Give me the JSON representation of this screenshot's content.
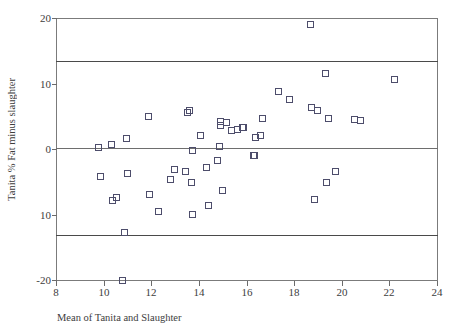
{
  "figure": {
    "faint_top_title": "",
    "marker_color": "#4d4d6b",
    "axis_color": "#6e6e6e",
    "reference_line_color": "#4a4a4a"
  },
  "chart_data": {
    "type": "scatter",
    "title": "",
    "xlabel": "Mean of Tanita and Slaughter",
    "ylabel": "Tanita % Fat minus slaughter",
    "xlim": [
      8,
      24
    ],
    "ylim": [
      -20,
      20
    ],
    "xticks": [
      8,
      10,
      12,
      14,
      16,
      18,
      20,
      22,
      24
    ],
    "xtick_labels": [
      "8",
      "10",
      "12",
      "14",
      "16",
      "18",
      "20",
      "22",
      "24"
    ],
    "yticks": [
      20,
      10,
      0,
      -10,
      -20
    ],
    "ytick_labels": [
      "20",
      "10",
      "0",
      "10",
      "-20"
    ],
    "grid": false,
    "legend": "none",
    "reference_lines": [
      {
        "label": "upper limit of agreement",
        "y": 13.4
      },
      {
        "label": "mean difference",
        "y": 0.1
      },
      {
        "label": "lower limit of agreement",
        "y": -13.2
      }
    ],
    "points": [
      {
        "x": 9.75,
        "y": 0.3
      },
      {
        "x": 9.85,
        "y": -4.1
      },
      {
        "x": 10.3,
        "y": 0.8
      },
      {
        "x": 10.35,
        "y": -7.8
      },
      {
        "x": 10.5,
        "y": -7.3
      },
      {
        "x": 10.75,
        "y": -20.0
      },
      {
        "x": 10.85,
        "y": -12.7
      },
      {
        "x": 10.95,
        "y": 1.7
      },
      {
        "x": 11.0,
        "y": -3.6
      },
      {
        "x": 11.85,
        "y": 5.0
      },
      {
        "x": 11.9,
        "y": -6.8
      },
      {
        "x": 12.3,
        "y": -9.4
      },
      {
        "x": 12.8,
        "y": -4.5
      },
      {
        "x": 12.95,
        "y": -3.0
      },
      {
        "x": 13.4,
        "y": -3.4
      },
      {
        "x": 13.5,
        "y": 5.6
      },
      {
        "x": 13.6,
        "y": 6.0
      },
      {
        "x": 13.65,
        "y": -5.0
      },
      {
        "x": 13.7,
        "y": -0.1
      },
      {
        "x": 13.7,
        "y": -9.9
      },
      {
        "x": 14.05,
        "y": 2.1
      },
      {
        "x": 14.3,
        "y": -2.7
      },
      {
        "x": 14.4,
        "y": -8.6
      },
      {
        "x": 14.75,
        "y": -1.7
      },
      {
        "x": 14.85,
        "y": 0.5
      },
      {
        "x": 14.9,
        "y": 4.3
      },
      {
        "x": 14.9,
        "y": 3.7
      },
      {
        "x": 14.95,
        "y": -6.3
      },
      {
        "x": 15.15,
        "y": 4.1
      },
      {
        "x": 15.35,
        "y": 2.9
      },
      {
        "x": 15.6,
        "y": 3.1
      },
      {
        "x": 15.8,
        "y": 3.4
      },
      {
        "x": 15.85,
        "y": 3.4
      },
      {
        "x": 16.25,
        "y": -0.9
      },
      {
        "x": 16.3,
        "y": -0.9
      },
      {
        "x": 16.35,
        "y": 1.9
      },
      {
        "x": 16.55,
        "y": 2.2
      },
      {
        "x": 16.65,
        "y": 4.7
      },
      {
        "x": 17.3,
        "y": 8.8
      },
      {
        "x": 17.8,
        "y": 7.6
      },
      {
        "x": 18.65,
        "y": 19.1
      },
      {
        "x": 18.7,
        "y": 6.4
      },
      {
        "x": 18.85,
        "y": -7.7
      },
      {
        "x": 18.95,
        "y": 5.9
      },
      {
        "x": 19.3,
        "y": 11.6
      },
      {
        "x": 19.35,
        "y": -5.1
      },
      {
        "x": 19.4,
        "y": 4.8
      },
      {
        "x": 19.7,
        "y": -3.4
      },
      {
        "x": 20.5,
        "y": 4.6
      },
      {
        "x": 20.75,
        "y": 4.5
      },
      {
        "x": 22.2,
        "y": 10.7
      }
    ]
  }
}
